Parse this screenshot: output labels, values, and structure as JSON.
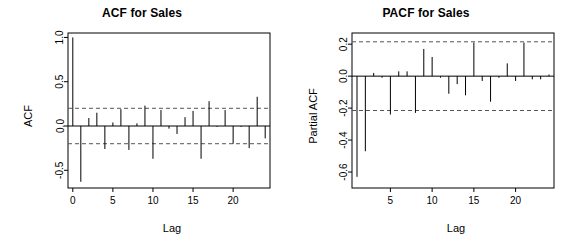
{
  "figure": {
    "background": "#ffffff",
    "line_color": "#000000",
    "conf_color": "#555555",
    "width": 568,
    "height": 244
  },
  "chart_data": [
    {
      "type": "bar",
      "id": "acf",
      "title": "ACF for Sales",
      "xlabel": "Lag",
      "ylabel": "ACF",
      "xlim": [
        -0.6,
        24.6
      ],
      "ylim": [
        -0.7,
        1.05
      ],
      "grid": false,
      "legend": "none",
      "xticks": [
        0,
        5,
        10,
        15,
        20
      ],
      "xticklabels": [
        "0",
        "5",
        "10",
        "15",
        "20"
      ],
      "yticks": [
        1.0,
        0.5,
        0.0,
        -0.5
      ],
      "yticklabels": [
        "1.0",
        "0.5",
        "0.0",
        "-0.5"
      ],
      "confidence_bands": [
        0.2,
        -0.2
      ],
      "confidence_style": "dashed",
      "x": [
        0,
        1,
        2,
        3,
        4,
        5,
        6,
        7,
        8,
        9,
        10,
        11,
        12,
        13,
        14,
        15,
        16,
        17,
        18,
        19,
        20,
        21,
        22,
        23,
        24
      ],
      "values": [
        1.0,
        -0.63,
        0.09,
        0.15,
        -0.26,
        0.04,
        0.19,
        -0.27,
        0.03,
        0.23,
        -0.37,
        0.18,
        -0.03,
        -0.09,
        0.1,
        0.17,
        -0.37,
        0.28,
        -0.01,
        0.18,
        -0.2,
        -0.01,
        -0.25,
        0.33,
        -0.14
      ]
    },
    {
      "type": "bar",
      "id": "pacf",
      "title": "PACF for Sales",
      "xlabel": "Lag",
      "ylabel": "Partial ACF",
      "xlim": [
        0.4,
        24.6
      ],
      "ylim": [
        -0.7,
        0.27
      ],
      "grid": false,
      "legend": "none",
      "xticks": [
        5,
        10,
        15,
        20
      ],
      "xticklabels": [
        "5",
        "10",
        "15",
        "20"
      ],
      "yticks": [
        0.2,
        0.0,
        -0.2,
        -0.4,
        -0.6
      ],
      "yticklabels": [
        "0.2",
        "0.0",
        "-0.2",
        "-0.4",
        "-0.6"
      ],
      "confidence_bands": [
        0.215,
        -0.215
      ],
      "confidence_style": "dashed",
      "x": [
        1,
        2,
        3,
        4,
        5,
        6,
        7,
        8,
        9,
        10,
        11,
        12,
        13,
        14,
        15,
        16,
        17,
        18,
        19,
        20,
        21,
        22,
        23,
        24
      ],
      "values": [
        -0.63,
        -0.47,
        0.02,
        -0.01,
        -0.24,
        0.03,
        0.03,
        -0.23,
        0.17,
        0.12,
        -0.01,
        -0.11,
        -0.05,
        -0.12,
        0.21,
        -0.03,
        -0.16,
        -0.01,
        0.08,
        -0.03,
        0.21,
        -0.02,
        -0.02,
        0.01
      ]
    }
  ]
}
